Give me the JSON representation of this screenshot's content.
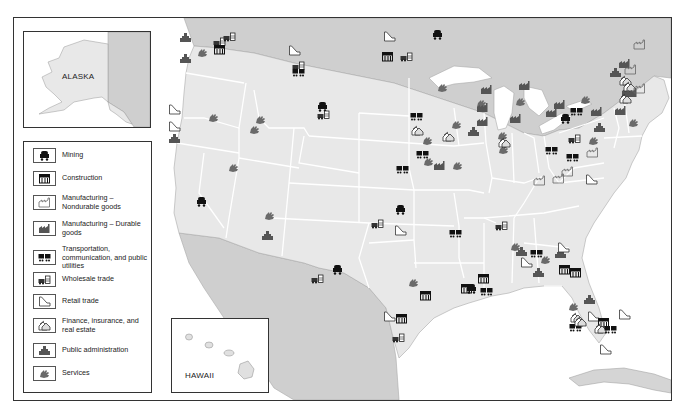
{
  "insets": {
    "alaska_label": "ALASKA",
    "hawaii_label": "HAWAII"
  },
  "legend": {
    "items": [
      {
        "key": "mining",
        "icon": "mining-cart-icon",
        "label": "Mining"
      },
      {
        "key": "construction",
        "icon": "construction-building-icon",
        "label": "Construction"
      },
      {
        "key": "mfg_nondurable",
        "icon": "factory-outline-icon",
        "label": "Manufacturing – Nondurable goods"
      },
      {
        "key": "mfg_durable",
        "icon": "factory-solid-icon",
        "label": "Manufacturing – Durable goods"
      },
      {
        "key": "transportation",
        "icon": "train-cars-icon",
        "label": "Transportation, communication, and public utilities"
      },
      {
        "key": "wholesale",
        "icon": "truck-warehouse-icon",
        "label": "Wholesale trade"
      },
      {
        "key": "retail",
        "icon": "retail-slope-icon",
        "label": "Retail trade"
      },
      {
        "key": "finance",
        "icon": "finance-houses-icon",
        "label": "Finance, insurance, and real estate"
      },
      {
        "key": "public_admin",
        "icon": "capitol-building-icon",
        "label": "Public administration"
      },
      {
        "key": "services",
        "icon": "hand-services-icon",
        "label": "Services"
      }
    ]
  },
  "markers": [
    {
      "region": "Washington",
      "type": "public_admin"
    },
    {
      "region": "Washington",
      "type": "wholesale"
    },
    {
      "region": "Washington",
      "type": "wholesale"
    },
    {
      "region": "Washington",
      "type": "construction"
    },
    {
      "region": "Washington",
      "type": "services"
    },
    {
      "region": "Oregon",
      "type": "public_admin"
    },
    {
      "region": "Montana",
      "type": "retail"
    },
    {
      "region": "Montana",
      "type": "wholesale"
    },
    {
      "region": "Montana",
      "type": "transportation"
    },
    {
      "region": "North Dakota",
      "type": "retail"
    },
    {
      "region": "North Dakota",
      "type": "construction"
    },
    {
      "region": "North Dakota",
      "type": "wholesale"
    },
    {
      "region": "Minnesota",
      "type": "mining"
    },
    {
      "region": "Wyoming",
      "type": "mining"
    },
    {
      "region": "Wyoming",
      "type": "wholesale"
    },
    {
      "region": "California",
      "type": "retail"
    },
    {
      "region": "California",
      "type": "retail"
    },
    {
      "region": "California",
      "type": "public_admin"
    },
    {
      "region": "California",
      "type": "mining"
    },
    {
      "region": "Nevada",
      "type": "services"
    },
    {
      "region": "Nevada",
      "type": "services"
    },
    {
      "region": "Utah",
      "type": "services"
    },
    {
      "region": "Arizona",
      "type": "public_admin"
    },
    {
      "region": "Nebraska",
      "type": "transportation"
    },
    {
      "region": "Nebraska",
      "type": "finance"
    },
    {
      "region": "Kansas",
      "type": "services"
    },
    {
      "region": "Kansas",
      "type": "transportation"
    },
    {
      "region": "Iowa",
      "type": "finance"
    },
    {
      "region": "Iowa",
      "type": "services"
    },
    {
      "region": "Missouri",
      "type": "services"
    },
    {
      "region": "Missouri",
      "type": "mfg_durable"
    },
    {
      "region": "Missouri",
      "type": "services"
    },
    {
      "region": "Missouri",
      "type": "transportation"
    },
    {
      "region": "Wisconsin",
      "type": "services"
    },
    {
      "region": "Wisconsin",
      "type": "mfg_durable"
    },
    {
      "region": "Illinois",
      "type": "services"
    },
    {
      "region": "Illinois",
      "type": "mfg_durable"
    },
    {
      "region": "Illinois",
      "type": "mfg_durable"
    },
    {
      "region": "Illinois",
      "type": "public_admin"
    },
    {
      "region": "Indiana",
      "type": "mfg_durable"
    },
    {
      "region": "Indiana",
      "type": "services"
    },
    {
      "region": "Indiana",
      "type": "services"
    },
    {
      "region": "Indiana",
      "type": "finance"
    },
    {
      "region": "Michigan",
      "type": "mfg_durable"
    },
    {
      "region": "Michigan",
      "type": "services"
    },
    {
      "region": "Ohio",
      "type": "mfg_durable"
    },
    {
      "region": "Ohio",
      "type": "mfg_durable"
    },
    {
      "region": "Pennsylvania",
      "type": "mining"
    },
    {
      "region": "Pennsylvania",
      "type": "transportation"
    },
    {
      "region": "Pennsylvania",
      "type": "services"
    },
    {
      "region": "Pennsylvania",
      "type": "mfg_durable"
    },
    {
      "region": "New York",
      "type": "public_admin"
    },
    {
      "region": "New York",
      "type": "finance"
    },
    {
      "region": "New York",
      "type": "mfg_durable"
    },
    {
      "region": "Vermont",
      "type": "mfg_durable"
    },
    {
      "region": "Maine",
      "type": "mfg_nondurable"
    },
    {
      "region": "New Hampshire",
      "type": "mfg_nondurable"
    },
    {
      "region": "Massachusetts",
      "type": "finance"
    },
    {
      "region": "Massachusetts",
      "type": "mfg_durable"
    },
    {
      "region": "Rhode Island",
      "type": "mfg_nondurable"
    },
    {
      "region": "Connecticut",
      "type": "finance"
    },
    {
      "region": "New Jersey",
      "type": "mfg_durable"
    },
    {
      "region": "New Jersey",
      "type": "services"
    },
    {
      "region": "Maryland",
      "type": "public_admin"
    },
    {
      "region": "Virginia",
      "type": "services"
    },
    {
      "region": "Virginia",
      "type": "mfg_nondurable"
    },
    {
      "region": "Kentucky",
      "type": "transportation"
    },
    {
      "region": "Tennessee",
      "type": "transportation"
    },
    {
      "region": "Tennessee",
      "type": "wholesale"
    },
    {
      "region": "North Carolina",
      "type": "mfg_nondurable"
    },
    {
      "region": "North Carolina",
      "type": "mfg_nondurable"
    },
    {
      "region": "North Carolina",
      "type": "mfg_nondurable"
    },
    {
      "region": "North Carolina",
      "type": "retail"
    },
    {
      "region": "Oklahoma",
      "type": "mining"
    },
    {
      "region": "Oklahoma",
      "type": "retail"
    },
    {
      "region": "Oklahoma",
      "type": "wholesale"
    },
    {
      "region": "New Mexico",
      "type": "services"
    },
    {
      "region": "Arkansas",
      "type": "transportation"
    },
    {
      "region": "Texas",
      "type": "mining"
    },
    {
      "region": "Texas",
      "type": "wholesale"
    },
    {
      "region": "Texas",
      "type": "services"
    },
    {
      "region": "Texas",
      "type": "construction"
    },
    {
      "region": "Texas",
      "type": "retail"
    },
    {
      "region": "Texas",
      "type": "construction"
    },
    {
      "region": "Texas",
      "type": "wholesale"
    },
    {
      "region": "Louisiana",
      "type": "construction"
    },
    {
      "region": "Louisiana",
      "type": "mining"
    },
    {
      "region": "Louisiana",
      "type": "construction"
    },
    {
      "region": "Louisiana",
      "type": "transportation"
    },
    {
      "region": "Mississippi",
      "type": "wholesale"
    },
    {
      "region": "Alabama",
      "type": "services"
    },
    {
      "region": "Alabama",
      "type": "public_admin"
    },
    {
      "region": "Alabama",
      "type": "retail"
    },
    {
      "region": "Georgia",
      "type": "transportation"
    },
    {
      "region": "Georgia",
      "type": "public_admin"
    },
    {
      "region": "Georgia",
      "type": "services"
    },
    {
      "region": "Georgia",
      "type": "public_admin"
    },
    {
      "region": "Georgia",
      "type": "retail"
    },
    {
      "region": "Florida",
      "type": "construction"
    },
    {
      "region": "Florida",
      "type": "public_admin"
    },
    {
      "region": "Florida",
      "type": "services"
    },
    {
      "region": "Florida",
      "type": "finance"
    },
    {
      "region": "Florida",
      "type": "transportation"
    },
    {
      "region": "Florida",
      "type": "retail"
    },
    {
      "region": "Florida",
      "type": "construction"
    },
    {
      "region": "Florida",
      "type": "construction"
    },
    {
      "region": "Florida",
      "type": "finance"
    },
    {
      "region": "Florida",
      "type": "finance"
    },
    {
      "region": "Florida",
      "type": "retail"
    },
    {
      "region": "Florida",
      "type": "transportation"
    },
    {
      "region": "Florida",
      "type": "retail"
    },
    {
      "region": "Utah",
      "type": "services"
    }
  ]
}
